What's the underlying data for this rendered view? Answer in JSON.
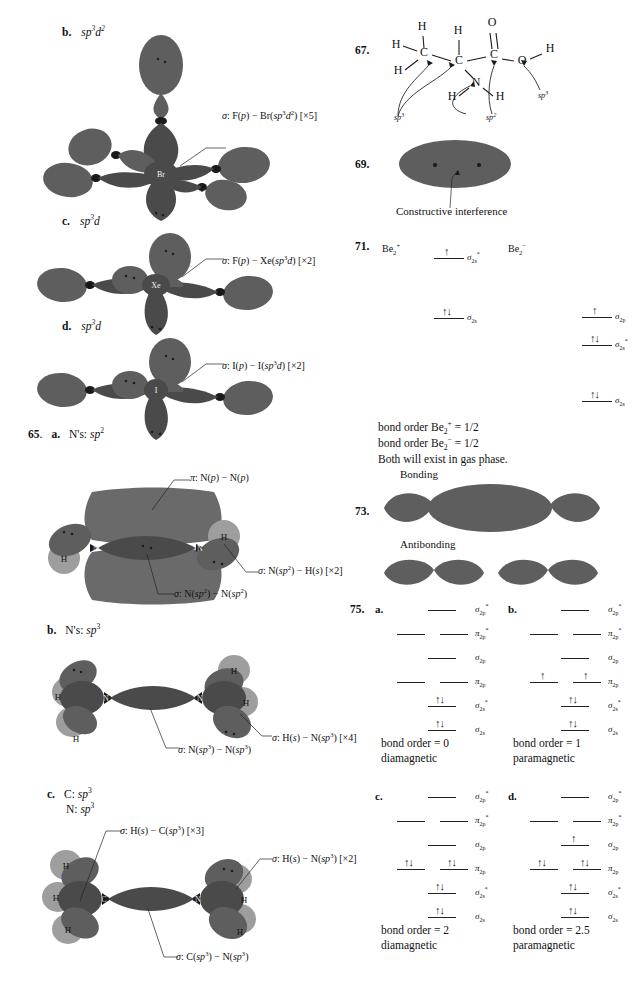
{
  "page": {
    "left_column": {
      "items": [
        {
          "marker": "b.",
          "hybrid": "sp3d2",
          "hybrid_html": "sp<sup>3</sup>d<sup>2</sup>",
          "center_atom": "Br",
          "peripheral_atoms": [
            "F",
            "F",
            "F",
            "F",
            "F"
          ],
          "annotations": [
            {
              "name": "sigma-F-Br",
              "text": "σ: F(p) − Br(sp3d2) [×5]"
            }
          ]
        },
        {
          "marker": "c.",
          "hybrid": "sp3d",
          "hybrid_html": "sp<sup>3</sup>d",
          "center_atom": "Xe",
          "peripheral_atoms": [
            "F",
            "F"
          ],
          "annotations": [
            {
              "name": "sigma-F-Xe",
              "text": "σ: F(p) − Xe(sp3d) [×2]"
            }
          ]
        },
        {
          "marker": "d.",
          "hybrid": "sp3d",
          "hybrid_html": "sp<sup>3</sup>d",
          "center_atom": "I",
          "peripheral_atoms": [
            "I",
            "I"
          ],
          "annotations": [
            {
              "name": "sigma-I-I",
              "text": "σ: I(p) − I(sp3d) [×2]"
            }
          ]
        }
      ],
      "problem_65": {
        "number": "65",
        "parts": [
          {
            "marker": "a.",
            "title": "N's: sp2",
            "atoms": [
              "N",
              "N",
              "H",
              "H"
            ],
            "annotations": [
              {
                "name": "pi-N-N",
                "text": "π: N(p) − N(p)"
              },
              {
                "name": "sigma-N-H",
                "text": "σ: N(sp2) − H(s) [×2]"
              },
              {
                "name": "sigma-N-N",
                "text": "σ: N(sp2) − N(sp2)"
              }
            ]
          },
          {
            "marker": "b.",
            "title": "N's: sp3",
            "atoms": [
              "N",
              "N",
              "H",
              "H",
              "H",
              "H"
            ],
            "annotations": [
              {
                "name": "sigma-H-N",
                "text": "σ: H(s) − N(sp3) [×4]"
              },
              {
                "name": "sigma-N-N",
                "text": "σ: N(sp3) − N(sp3)"
              }
            ]
          },
          {
            "marker": "c.",
            "title_line1": "C: sp3",
            "title_line2": "N: sp3",
            "atoms": [
              "C",
              "N",
              "H",
              "H",
              "H",
              "H",
              "H"
            ],
            "annotations": [
              {
                "name": "sigma-H-C",
                "text": "σ: H(s) − C(sp3) [×3]"
              },
              {
                "name": "sigma-H-N",
                "text": "σ: H(s) − N(sp3) [×2]"
              },
              {
                "name": "sigma-C-N",
                "text": "σ: C(sp3) − N(sp3)"
              }
            ]
          }
        ]
      }
    },
    "right_column": {
      "problem_67": {
        "number": "67.",
        "atom_labels": [
          "H",
          "H",
          "H",
          "C",
          "H",
          "C",
          "O",
          "C",
          "O",
          "H",
          "N",
          "H",
          "H"
        ],
        "hybrid_callouts": [
          "sp3",
          "sp2",
          "sp3"
        ]
      },
      "problem_69": {
        "number": "69.",
        "caption": "Constructive interference"
      },
      "problem_71": {
        "number": "71.",
        "species_left": "Be2+",
        "species_right": "Be2−",
        "left_levels": [
          {
            "label": "sigma*2s",
            "electrons": 1,
            "y": 0
          },
          {
            "label": "sigma2s",
            "electrons": 2,
            "y": 95
          }
        ],
        "right_levels": [
          {
            "label": "sigma2p",
            "electrons": 1
          },
          {
            "label": "sigma*2s",
            "electrons": 2
          },
          {
            "label": "sigma2s",
            "electrons": 2
          }
        ],
        "text_lines": [
          "bond order Be2+ = 1/2",
          "bond order Be2− = 1/2",
          "Both will exist in gas phase."
        ]
      },
      "problem_73": {
        "number": "73.",
        "labels": [
          "Bonding",
          "Antibonding"
        ]
      },
      "problem_75": {
        "number": "75.",
        "parts": [
          {
            "marker": "a.",
            "levels": [
              {
                "label": "sigma*2p",
                "type": "single",
                "electrons": [
                  0
                ]
              },
              {
                "label": "pi*2p",
                "type": "double",
                "electrons": [
                  0,
                  0
                ]
              },
              {
                "label": "sigma2p",
                "type": "single",
                "electrons": [
                  0
                ]
              },
              {
                "label": "pi2p",
                "type": "double",
                "electrons": [
                  0,
                  0
                ]
              },
              {
                "label": "sigma*2s",
                "type": "single",
                "electrons": [
                  2
                ]
              },
              {
                "label": "sigma2s",
                "type": "single",
                "electrons": [
                  2
                ]
              }
            ],
            "bond_order": "bond order = 0",
            "magnetism": "diamagnetic"
          },
          {
            "marker": "b.",
            "levels": [
              {
                "label": "sigma*2p",
                "type": "single",
                "electrons": [
                  0
                ]
              },
              {
                "label": "pi*2p",
                "type": "double",
                "electrons": [
                  0,
                  0
                ]
              },
              {
                "label": "sigma2p",
                "type": "single",
                "electrons": [
                  0
                ]
              },
              {
                "label": "pi2p",
                "type": "double",
                "electrons": [
                  1,
                  1
                ]
              },
              {
                "label": "sigma*2s",
                "type": "single",
                "electrons": [
                  2
                ]
              },
              {
                "label": "sigma2s",
                "type": "single",
                "electrons": [
                  2
                ]
              }
            ],
            "bond_order": "bond order = 1",
            "magnetism": "paramagnetic"
          },
          {
            "marker": "c.",
            "levels": [
              {
                "label": "sigma*2p",
                "type": "single",
                "electrons": [
                  0
                ]
              },
              {
                "label": "pi*2p",
                "type": "double",
                "electrons": [
                  0,
                  0
                ]
              },
              {
                "label": "sigma2p",
                "type": "single",
                "electrons": [
                  0
                ]
              },
              {
                "label": "pi2p",
                "type": "double",
                "electrons": [
                  2,
                  2
                ]
              },
              {
                "label": "sigma*2s",
                "type": "single",
                "electrons": [
                  2
                ]
              },
              {
                "label": "sigma2s",
                "type": "single",
                "electrons": [
                  2
                ]
              }
            ],
            "bond_order": "bond order = 2",
            "magnetism": "diamagnetic"
          },
          {
            "marker": "d.",
            "levels": [
              {
                "label": "sigma*2p",
                "type": "single",
                "electrons": [
                  0
                ]
              },
              {
                "label": "pi*2p",
                "type": "double",
                "electrons": [
                  0,
                  0
                ]
              },
              {
                "label": "sigma2p",
                "type": "single",
                "electrons": [
                  1
                ]
              },
              {
                "label": "pi2p",
                "type": "double",
                "electrons": [
                  2,
                  2
                ]
              },
              {
                "label": "sigma*2s",
                "type": "single",
                "electrons": [
                  2
                ]
              },
              {
                "label": "sigma2s",
                "type": "single",
                "electrons": [
                  2
                ]
              }
            ],
            "bond_order": "bond order = 2.5",
            "magnetism": "paramagnetic"
          }
        ]
      }
    }
  }
}
